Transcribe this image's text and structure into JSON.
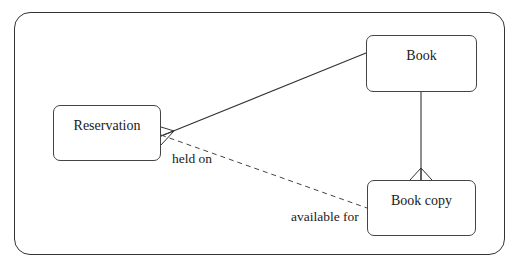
{
  "diagram": {
    "type": "entity-relationship",
    "entities": [
      {
        "id": "reservation",
        "label": "Reservation"
      },
      {
        "id": "book",
        "label": "Book"
      },
      {
        "id": "book_copy",
        "label": "Book copy"
      }
    ],
    "relationships": [
      {
        "from": "reservation",
        "to": "book",
        "style": "solid",
        "crows_foot_at": "reservation"
      },
      {
        "from": "book",
        "to": "book_copy",
        "style": "solid",
        "crows_foot_at": "book_copy"
      },
      {
        "from": "reservation",
        "to": "book_copy",
        "style": "dashed",
        "label_from": "held on",
        "label_to": "available for"
      }
    ],
    "labels": {
      "held_on": "held on",
      "available_for": "available for"
    },
    "colors": {
      "line": "#333333",
      "background": "#ffffff"
    }
  }
}
